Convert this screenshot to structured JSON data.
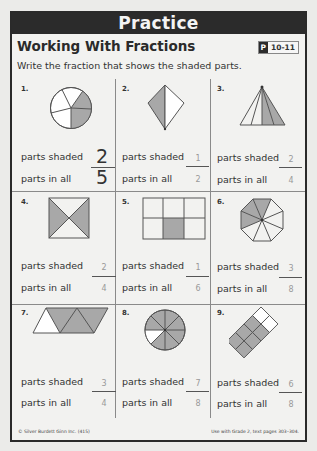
{
  "banner": "Practice",
  "title": "Working With Fractions",
  "badge": {
    "prefix": "P",
    "pages": "10-11"
  },
  "instruction": "Write the fraction that shows the shaded parts.",
  "labels": {
    "shaded": "parts shaded",
    "all": "parts in all"
  },
  "problems": [
    {
      "number": "1.",
      "shape": "circle-5",
      "shaded": "2",
      "total": "5"
    },
    {
      "number": "2.",
      "shape": "kite-2",
      "shaded": "1",
      "total": "2"
    },
    {
      "number": "3.",
      "shape": "triangle-4",
      "shaded": "2",
      "total": "4"
    },
    {
      "number": "4.",
      "shape": "square-x-4",
      "shaded": "2",
      "total": "4"
    },
    {
      "number": "5.",
      "shape": "rectangle-6",
      "shaded": "1",
      "total": "6"
    },
    {
      "number": "6.",
      "shape": "octagon-8",
      "shaded": "3",
      "total": "8"
    },
    {
      "number": "7.",
      "shape": "parallelogram-4",
      "shaded": "3",
      "total": "4"
    },
    {
      "number": "8.",
      "shape": "circle-8",
      "shaded": "7",
      "total": "8"
    },
    {
      "number": "9.",
      "shape": "diamond-grid-8",
      "shaded": "6",
      "total": "8"
    }
  ],
  "footer": {
    "left": "© Silver Burdett Ginn Inc. (415)",
    "right": "Use with Grade 2, text pages 303–304."
  },
  "colors": {
    "shade": "#a8a8a8",
    "banner": "#2b2b2b"
  }
}
